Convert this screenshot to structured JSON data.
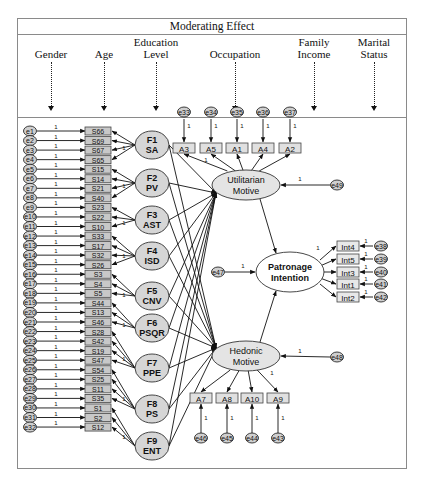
{
  "header": {
    "title": "Moderating Effect",
    "moderators": [
      {
        "line1": "",
        "line2": "Gender",
        "x": 33
      },
      {
        "line1": "",
        "line2": "Age",
        "x": 86
      },
      {
        "line1": "Education",
        "line2": "Level",
        "x": 138
      },
      {
        "line1": "",
        "line2": "Occupation",
        "x": 217
      },
      {
        "line1": "Family",
        "line2": "Income",
        "x": 296
      },
      {
        "line1": "Marital",
        "line2": "Status",
        "x": 356
      }
    ]
  },
  "colors": {
    "factor_fill": "#d6d6d6",
    "indicator_fill": "#c8c8c8",
    "construct_fill": "#e4e4e4",
    "line": "#111111",
    "frame": "#8a8a8a"
  },
  "left_errors": [
    "e1",
    "e2",
    "e3",
    "e4",
    "e5",
    "e6",
    "e7",
    "e8",
    "e9",
    "e10",
    "e11",
    "e12",
    "e13",
    "e14",
    "e15",
    "e16",
    "e17",
    "e18",
    "e19",
    "e20",
    "e21",
    "e22",
    "e23",
    "e24",
    "e25",
    "e26",
    "e27",
    "e28",
    "e29",
    "e30",
    "e31",
    "e32"
  ],
  "left_indicators": [
    "S66",
    "S69",
    "S67",
    "S65",
    "S15",
    "S14",
    "S21",
    "S40",
    "S23",
    "S22",
    "S10",
    "S33",
    "S17",
    "S32",
    "S26",
    "S3",
    "S4",
    "S5",
    "S44",
    "S13",
    "S46",
    "S28",
    "S42",
    "S19",
    "S47",
    "S54",
    "S25",
    "S11",
    "S35",
    "S1",
    "S2",
    "S12"
  ],
  "path_weight": "1",
  "factors": [
    {
      "id": "F1",
      "name": "SA",
      "items": [
        0,
        1,
        2,
        3
      ]
    },
    {
      "id": "F2",
      "name": "PV",
      "items": [
        4,
        5,
        6,
        7
      ]
    },
    {
      "id": "F3",
      "name": "AST",
      "items": [
        8,
        9,
        10
      ]
    },
    {
      "id": "F4",
      "name": "ISD",
      "items": [
        11,
        12,
        13,
        14
      ]
    },
    {
      "id": "F5",
      "name": "CNV",
      "items": [
        15,
        16,
        17
      ]
    },
    {
      "id": "F6",
      "name": "PSQR",
      "items": [
        18,
        19,
        20
      ]
    },
    {
      "id": "F7",
      "name": "PPE",
      "items": [
        21,
        22,
        23,
        24
      ]
    },
    {
      "id": "F8",
      "name": "PS",
      "items": [
        25,
        26,
        27,
        28
      ]
    },
    {
      "id": "F9",
      "name": "ENT",
      "items": [
        29,
        30,
        31
      ]
    }
  ],
  "utilitarian": {
    "line1": "Utilitarian",
    "line2": "Motive",
    "indicators": [
      "A3",
      "A5",
      "A1",
      "A4",
      "A2"
    ],
    "errors": [
      "e33",
      "e34",
      "e35",
      "e36",
      "e37"
    ],
    "disturbance": "e49"
  },
  "hedonic": {
    "line1": "Hedonic",
    "line2": "Motive",
    "indicators": [
      "A7",
      "A8",
      "A10",
      "A9"
    ],
    "errors": [
      "e46",
      "e45",
      "e44",
      "e43"
    ],
    "disturbance": "e48"
  },
  "patronage": {
    "line1": "Patronage",
    "line2": "Intention",
    "indicators": [
      "Int4",
      "Int5",
      "Int3",
      "Int1",
      "Int2"
    ],
    "errors": [
      "e38",
      "e39",
      "e40",
      "e41",
      "e42"
    ],
    "disturbance": "e47"
  }
}
